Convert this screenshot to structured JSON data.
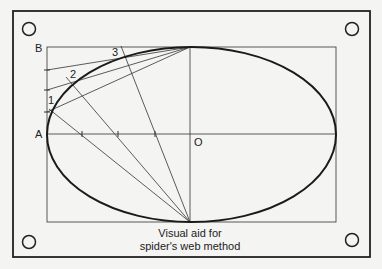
{
  "diagram": {
    "labels": {
      "B": "B",
      "A": "A",
      "O": "O",
      "p1": "1",
      "p2": "2",
      "p3": "3"
    },
    "caption": {
      "line1": "Visual aid for",
      "line2": "spider's web method"
    },
    "colors": {
      "background": "#f4f4f2",
      "ink": "#222222"
    }
  }
}
